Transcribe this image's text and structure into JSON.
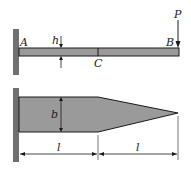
{
  "diagram": {
    "type": "cantilever-beam-tapered",
    "colors": {
      "wall": "#6f6f6f",
      "beam_fill": "#9a9a9a",
      "outline": "#1a1a1a",
      "background": "#ffffff"
    },
    "side_view": {
      "label_A": "A",
      "label_B": "B",
      "label_C": "C",
      "label_h": "h",
      "load_label": "P"
    },
    "top_view": {
      "label_b": "b",
      "dim_left": "l",
      "dim_right": "l"
    }
  }
}
